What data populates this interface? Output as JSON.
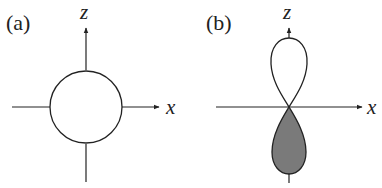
{
  "figure": {
    "panels": [
      {
        "id": "a",
        "label": "(a)",
        "shape": "circle",
        "description": "s orbital (spherical) centred at origin",
        "axes": {
          "horizontal": "x",
          "vertical": "z"
        }
      },
      {
        "id": "b",
        "label": "(b)",
        "shape": "two-lobe",
        "description": "p_z orbital with unshaded upper lobe and shaded lower lobe",
        "axes": {
          "horizontal": "x",
          "vertical": "z"
        },
        "lobes": [
          {
            "position": "upper",
            "fill": "#ffffff"
          },
          {
            "position": "lower",
            "fill": "#7a7a7a"
          }
        ]
      }
    ]
  },
  "colors": {
    "stroke": "#222222",
    "lobe_shaded": "#7a7a7a",
    "background": "#ffffff"
  }
}
